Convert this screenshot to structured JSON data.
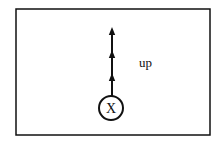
{
  "diagram": {
    "frame": {
      "x": 16,
      "y": 9,
      "width": 194,
      "height": 126,
      "stroke": "#111111",
      "stroke_width": 1.5
    },
    "particle": {
      "symbol": "X",
      "cx": 111,
      "cy": 108,
      "r": 12,
      "stroke": "#111111",
      "stroke_width": 2
    },
    "trajectory": {
      "x": 112,
      "y_start": 96,
      "y_end": 27,
      "arrowheads_y": [
        27,
        50,
        73
      ],
      "stroke": "#111111",
      "stroke_width": 2,
      "direction": "up"
    },
    "direction_label": {
      "text": "up",
      "x": 139,
      "y": 67
    }
  }
}
